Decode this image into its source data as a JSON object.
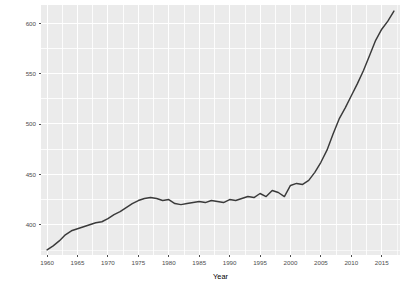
{
  "chart_data": {
    "type": "line",
    "title": "",
    "subtitle": "",
    "xlabel": "Year",
    "ylabel": "No. Active Mines",
    "xlim": [
      1959,
      2018
    ],
    "ylim": [
      370,
      618
    ],
    "grid": true,
    "legend": false,
    "legend_position": "none",
    "line_color": "#3a3a3a",
    "panel_background": "#ebebeb",
    "gridline_color": "#ffffff",
    "x_ticks": [
      1960,
      1965,
      1970,
      1975,
      1980,
      1985,
      1990,
      1995,
      2000,
      2005,
      2010,
      2015
    ],
    "x_tick_labels": [
      "1960",
      "1965",
      "1970",
      "1975",
      "1980",
      "1985",
      "1990",
      "1995",
      "2000",
      "2005",
      "2010",
      "2015"
    ],
    "y_ticks": [
      400,
      450,
      500,
      550,
      600
    ],
    "y_tick_labels": [
      "400",
      "450",
      "500",
      "550",
      "600"
    ],
    "x": [
      1960,
      1961,
      1962,
      1963,
      1964,
      1965,
      1966,
      1967,
      1968,
      1969,
      1970,
      1971,
      1972,
      1973,
      1974,
      1975,
      1976,
      1977,
      1978,
      1979,
      1980,
      1981,
      1982,
      1983,
      1984,
      1985,
      1986,
      1987,
      1988,
      1989,
      1990,
      1991,
      1992,
      1993,
      1994,
      1995,
      1996,
      1997,
      1998,
      1999,
      2000,
      2001,
      2002,
      2003,
      2004,
      2005,
      2006,
      2007,
      2008,
      2009,
      2010,
      2011,
      2012,
      2013,
      2014,
      2015,
      2016,
      2017
    ],
    "y": [
      375,
      379,
      384,
      390,
      394,
      396,
      398,
      400,
      402,
      403,
      406,
      410,
      413,
      417,
      421,
      424,
      426,
      427,
      426,
      424,
      425,
      421,
      420,
      421,
      422,
      423,
      422,
      424,
      423,
      422,
      425,
      424,
      426,
      428,
      427,
      431,
      428,
      434,
      432,
      428,
      439,
      441,
      440,
      444,
      452,
      462,
      474,
      490,
      505,
      516,
      528,
      540,
      553,
      568,
      583,
      594,
      602,
      612
    ],
    "series": [
      {
        "name": "No. Active Mines",
        "values": [
          375,
          379,
          384,
          390,
          394,
          396,
          398,
          400,
          402,
          403,
          406,
          410,
          413,
          417,
          421,
          424,
          426,
          427,
          426,
          424,
          425,
          421,
          420,
          421,
          422,
          423,
          422,
          424,
          423,
          422,
          425,
          424,
          426,
          428,
          427,
          431,
          428,
          434,
          432,
          428,
          439,
          441,
          440,
          444,
          452,
          462,
          474,
          490,
          505,
          516,
          528,
          540,
          553,
          568,
          583,
          594,
          602,
          612
        ]
      }
    ]
  }
}
